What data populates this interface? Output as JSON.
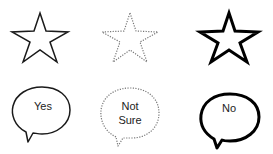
{
  "stars": [
    {
      "name": "star-solid",
      "style": "solid",
      "stroke": "#1a1a1a",
      "stroke_width": 1.5
    },
    {
      "name": "star-dotted",
      "style": "dotted",
      "stroke": "#777777",
      "stroke_width": 1.2
    },
    {
      "name": "star-bold",
      "style": "bold",
      "stroke": "#000000",
      "stroke_width": 3
    }
  ],
  "bubbles": [
    {
      "name": "bubble-yes",
      "lines": [
        "Yes"
      ],
      "style": "solid",
      "stroke": "#1a1a1a"
    },
    {
      "name": "bubble-not-sure",
      "lines": [
        "Not",
        "Sure"
      ],
      "style": "dotted",
      "stroke": "#777777"
    },
    {
      "name": "bubble-no",
      "lines": [
        "No"
      ],
      "style": "bold",
      "stroke": "#000000"
    }
  ]
}
